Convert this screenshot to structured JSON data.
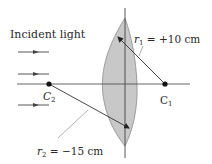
{
  "figure": {
    "type": "thin-lens-radii-diagram",
    "incident_light_label": "Incident light",
    "r1": {
      "symbol": "r",
      "subscript": "1",
      "equals": " = ",
      "value": "+10 cm"
    },
    "r2": {
      "symbol": "r",
      "subscript": "2",
      "equals": " = ",
      "value": "−15 cm"
    },
    "c1": {
      "symbol": "C",
      "subscript": "1"
    },
    "c2": {
      "symbol": "C",
      "subscript": "2"
    },
    "incident_arrow_count": 3,
    "colors": {
      "lens_fill": "#c8c8c8",
      "lens_stroke": "#8a8a8a",
      "line": "#3a3a3a",
      "axis": "#555555",
      "point": "#111111",
      "text": "#2a2a2a"
    }
  }
}
